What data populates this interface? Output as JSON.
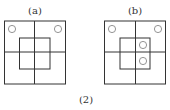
{
  "caption": "(2)",
  "panels": [
    {
      "label": "(a)",
      "outer": {
        "x": 4.5,
        "y": 21,
        "w": 61,
        "h": 63
      },
      "vline_x": 34.5,
      "hline_y": 52,
      "inner": {
        "x": 19.5,
        "y": 38,
        "w": 30.5,
        "h": 31
      },
      "circles": [
        {
          "cx": 12,
          "cy": 29
        },
        {
          "cx": 58,
          "cy": 29
        }
      ]
    },
    {
      "label": "(b)",
      "outer": {
        "x": 104.5,
        "y": 21,
        "w": 61,
        "h": 63
      },
      "vline_x": 135.5,
      "hline_y": 52,
      "inner": {
        "x": 120,
        "y": 38,
        "w": 30,
        "h": 31
      },
      "circles": [
        {
          "cx": 112,
          "cy": 29
        },
        {
          "cx": 158,
          "cy": 29
        },
        {
          "cx": 143,
          "cy": 45
        },
        {
          "cx": 143,
          "cy": 61
        }
      ]
    }
  ],
  "colors": {
    "line": "#333333",
    "circle": "#888888"
  }
}
